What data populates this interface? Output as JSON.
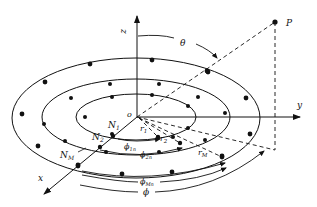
{
  "diagram": {
    "axes": {
      "x": "x",
      "y": "y",
      "z": "z",
      "origin": "o"
    },
    "point": "P",
    "angles": {
      "theta": "θ",
      "phi": "ϕ",
      "phi_1n": "ϕ",
      "phi_1n_sub": "1n",
      "phi_2n": "ϕ",
      "phi_2n_sub": "2n",
      "phi_Mn": "ϕ",
      "phi_Mn_sub": "Mn"
    },
    "rings": [
      {
        "label": "N",
        "sub": "1",
        "radius_label": "r",
        "radius_sub": "1"
      },
      {
        "label": "N",
        "sub": "2",
        "radius_label": "r",
        "radius_sub": "2"
      },
      {
        "label": "N",
        "sub": "M",
        "radius_label": "r",
        "radius_sub": "M"
      }
    ]
  }
}
